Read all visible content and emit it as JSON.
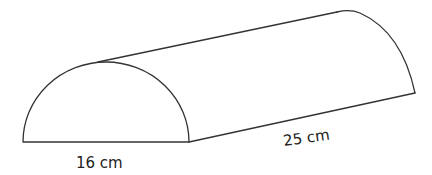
{
  "diagram": {
    "type": "half-cylinder",
    "labels": {
      "diameter": "16 cm",
      "length": "25 cm"
    },
    "colors": {
      "stroke": "#333333",
      "text": "#222222",
      "background": "#ffffff"
    }
  }
}
